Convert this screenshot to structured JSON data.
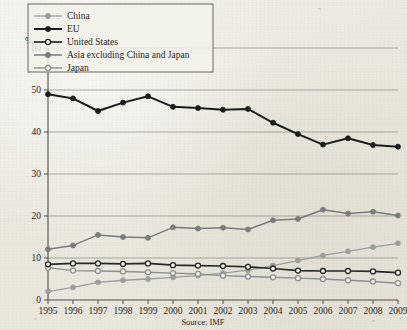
{
  "chart_data": {
    "type": "line",
    "title": "",
    "subtitle": "",
    "xlabel": "",
    "ylabel": "%",
    "source": "Source: IMF",
    "grid": "horizontal",
    "legend_position": "top-left",
    "xlim": [
      1995,
      2009
    ],
    "ylim": [
      0,
      60
    ],
    "yticks": [
      0,
      10,
      20,
      30,
      40,
      50,
      60
    ],
    "categories": [
      1995,
      1996,
      1997,
      1998,
      1999,
      2000,
      2001,
      2002,
      2003,
      2004,
      2005,
      2006,
      2007,
      2008,
      2009
    ],
    "xtick_labels": [
      "1995",
      "1996",
      "1997",
      "1998",
      "1999",
      "2000",
      "2001",
      "2002",
      "2003",
      "2004",
      "2005",
      "2006",
      "2007",
      "2008",
      "2009"
    ],
    "ytick_labels": [
      "0",
      "10",
      "20",
      "30",
      "40",
      "50",
      "60"
    ],
    "series": [
      {
        "name": "China",
        "color": "#9d9d9d",
        "marker": "filled-circle",
        "line_width": 1.3,
        "values": [
          2.0,
          3.0,
          4.2,
          4.7,
          5.0,
          5.4,
          5.8,
          6.4,
          7.1,
          8.2,
          9.4,
          10.6,
          11.6,
          12.6,
          13.5
        ]
      },
      {
        "name": "EU",
        "color": "#1b1b1b",
        "marker": "filled-circle",
        "line_width": 2.0,
        "values": [
          49.0,
          48.0,
          45.0,
          47.0,
          48.5,
          46.0,
          45.7,
          45.3,
          45.5,
          42.2,
          39.5,
          37.0,
          38.5,
          36.9,
          36.5
        ]
      },
      {
        "name": "United States",
        "color": "#272727",
        "marker": "open-circle",
        "line_width": 1.7,
        "values": [
          8.5,
          8.7,
          8.7,
          8.6,
          8.7,
          8.3,
          8.2,
          8.1,
          7.9,
          7.5,
          7.0,
          6.9,
          6.9,
          6.8,
          6.5
        ]
      },
      {
        "name": "Asia excluding China and Japan",
        "color": "#7b7b7b",
        "marker": "filled-circle",
        "line_width": 1.5,
        "values": [
          12.1,
          13.0,
          15.5,
          15.0,
          14.8,
          17.3,
          17.0,
          17.2,
          16.8,
          19.0,
          19.3,
          21.5,
          20.6,
          21.0,
          20.1
        ]
      },
      {
        "name": "Japan",
        "color": "#8f8f8f",
        "marker": "open-circle",
        "line_width": 1.4,
        "values": [
          7.7,
          7.0,
          6.9,
          6.8,
          6.6,
          6.4,
          6.2,
          5.8,
          5.6,
          5.4,
          5.2,
          5.0,
          4.7,
          4.4,
          4.0
        ]
      }
    ]
  },
  "legend": {
    "items": [
      {
        "label": "China"
      },
      {
        "label": "EU"
      },
      {
        "label": "United States"
      },
      {
        "label": "Asia excluding China and Japan"
      },
      {
        "label": "Japan"
      }
    ]
  },
  "axis": {
    "unit_label": "%"
  },
  "caption": {
    "source": "Source: IMF"
  }
}
